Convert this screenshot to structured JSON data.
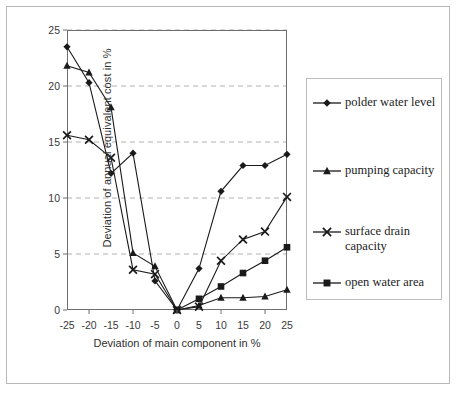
{
  "chart_data": {
    "type": "line",
    "title": "",
    "xlabel": "Deviation of main component in %",
    "ylabel": "Deviation of annual equivalent cost in %",
    "x": [
      -25,
      -20,
      -15,
      -10,
      -5,
      0,
      5,
      10,
      15,
      20,
      25
    ],
    "xtick_labels": [
      "-25",
      "-20",
      "-15",
      "-10",
      "-5",
      "0",
      "5",
      "10",
      "15",
      "20",
      "25"
    ],
    "ytick_labels": [
      "0",
      "5",
      "10",
      "15",
      "20",
      "25"
    ],
    "yticks": [
      0,
      5,
      10,
      15,
      20,
      25
    ],
    "xlim": [
      -25,
      25
    ],
    "ylim": [
      0,
      25
    ],
    "grid": "horizontal-dashed",
    "legend_position": "right",
    "series": [
      {
        "name": "polder water level",
        "marker": "diamond",
        "values": [
          23.5,
          20.3,
          12.2,
          14.0,
          2.6,
          0.0,
          3.7,
          10.6,
          12.9,
          12.9,
          13.9
        ]
      },
      {
        "name": "pumping capacity",
        "marker": "triangle",
        "values": [
          21.8,
          21.2,
          18.1,
          5.1,
          3.9,
          0.0,
          0.4,
          1.1,
          1.1,
          1.2,
          1.8
        ]
      },
      {
        "name": "surface drain capacity",
        "marker": "cross",
        "values": [
          15.6,
          15.2,
          13.6,
          3.6,
          3.2,
          0.0,
          0.3,
          4.4,
          6.3,
          7.0,
          10.1
        ]
      },
      {
        "name": "open water area",
        "marker": "square",
        "values": [
          null,
          null,
          null,
          null,
          null,
          0.0,
          1.0,
          2.1,
          3.3,
          4.4,
          5.6
        ]
      }
    ]
  },
  "legend": {
    "entries": [
      {
        "label": "polder water level",
        "marker": "diamond"
      },
      {
        "label": "pumping capacity",
        "marker": "triangle"
      },
      {
        "label": "surface drain capacity",
        "marker": "cross"
      },
      {
        "label": "open water area",
        "marker": "square"
      }
    ]
  },
  "colors": {
    "series": "#1a1a1a",
    "axis": "#6e6e6e",
    "grid": "#b0b0b0",
    "frame": "#b9b9b9",
    "text": "#303030"
  }
}
